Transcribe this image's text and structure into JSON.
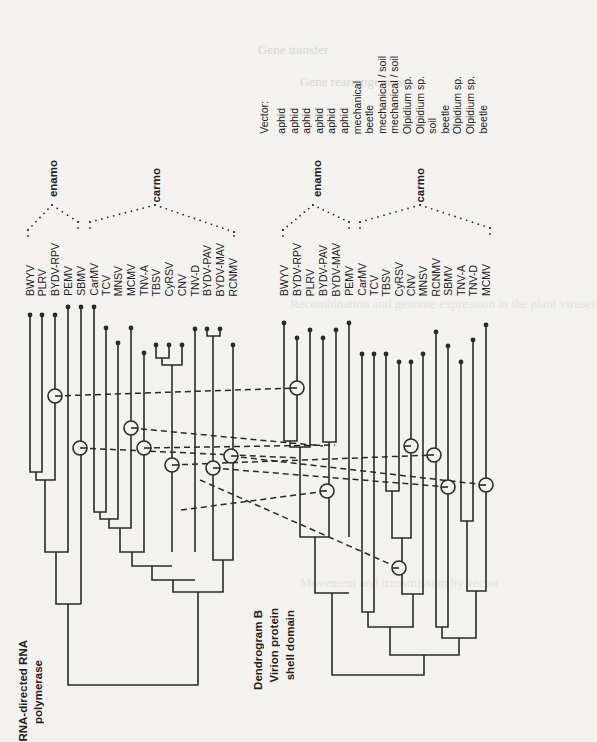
{
  "figure": {
    "orientation": "rotated-90-ccw",
    "background_text": {
      "header_1": "Gene transfer",
      "header_2": "Gene rearrangement",
      "header_3": "Recombination and genome expression in the plant viruses",
      "header_4": "Movement and transmission by vector"
    },
    "dendrogram_a": {
      "title_line1": "RNA-directed RNA",
      "title_line2": "polymerase",
      "leaves": [
        "BWYV",
        "PLRV",
        "BYDV-RPV",
        "PEMV",
        "SBMV",
        "CarMV",
        "TCV",
        "MNSV",
        "MCMV",
        "TNV-A",
        "TBSV",
        "CyRSV",
        "CNV",
        "TNV-D",
        "BYDV-PAV",
        "BYDV-MAV",
        "RCNMV"
      ],
      "groups": [
        {
          "label": "enamo"
        },
        {
          "label": "carmo"
        }
      ]
    },
    "dendrogram_b": {
      "title_line1": "Dendrogram B",
      "title_line2": "Virion protein",
      "title_line3": "shell domain",
      "leaves": [
        "BWYV",
        "BYDV-RPV",
        "PLRV",
        "BYDV-PAV",
        "BYDV-MAV",
        "PEMV",
        "CarMV",
        "TCV",
        "TBSV",
        "CyRSV",
        "CNV",
        "MNSV",
        "RCNMV",
        "SBMV",
        "TNV-A",
        "TNV-D",
        "MCMV"
      ],
      "groups": [
        {
          "label": "enamo"
        },
        {
          "label": "carmo"
        }
      ]
    },
    "vector": {
      "heading": "Vector:",
      "values": [
        "aphid",
        "aphid",
        "aphid",
        "aphid",
        "aphid",
        "aphid",
        "mechanical",
        "beetle",
        "mechanical / soil",
        "mechanical / soil",
        "Olpidium sp.",
        "Olpidium sp.",
        "soil",
        "beetle",
        "Olpidium sp.",
        "Olpidium sp.",
        "beetle"
      ]
    },
    "colors": {
      "ink": "#2a2a2a",
      "paper": "#f3f2ef"
    }
  }
}
